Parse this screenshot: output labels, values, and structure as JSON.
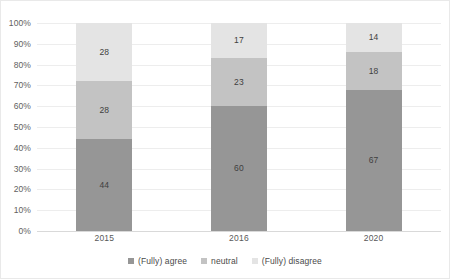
{
  "chart_data": {
    "type": "bar",
    "subtype": "stacked-100-percent",
    "title": "",
    "xlabel": "",
    "ylabel": "",
    "categories": [
      "2015",
      "2016",
      "2020"
    ],
    "series": [
      {
        "name": "(Fully) agree",
        "values": [
          44,
          60,
          67
        ],
        "color": "#969696"
      },
      {
        "name": "neutral",
        "values": [
          28,
          23,
          18
        ],
        "color": "#c3c3c3"
      },
      {
        "name": "(Fully) disagree",
        "values": [
          28,
          17,
          14
        ],
        "color": "#e4e4e4"
      }
    ],
    "ylim": [
      0,
      100
    ],
    "y_ticks": [
      "0%",
      "10%",
      "20%",
      "30%",
      "40%",
      "50%",
      "60%",
      "70%",
      "80%",
      "90%",
      "100%"
    ],
    "y_tick_values": [
      0,
      10,
      20,
      30,
      40,
      50,
      60,
      70,
      80,
      90,
      100
    ],
    "grid": true,
    "legend_position": "bottom",
    "data_labels": true
  },
  "colors": {
    "agree": "#969696",
    "neutral": "#c3c3c3",
    "disagree": "#e4e4e4",
    "gridline": "#ededed",
    "baseline": "#d9d9d9",
    "text": "#595959",
    "background": "#ffffff"
  }
}
